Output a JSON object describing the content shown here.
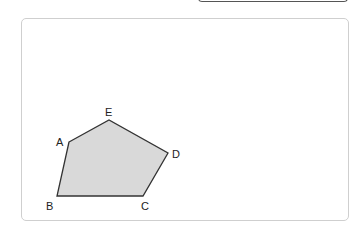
{
  "figure": {
    "shape": "pentagon",
    "fill_color": "#d9d9d9",
    "stroke_color": "#333333",
    "vertices": [
      {
        "name": "A",
        "label": "A"
      },
      {
        "name": "E",
        "label": "E"
      },
      {
        "name": "D",
        "label": "D"
      },
      {
        "name": "C",
        "label": "C"
      },
      {
        "name": "B",
        "label": "B"
      }
    ]
  }
}
